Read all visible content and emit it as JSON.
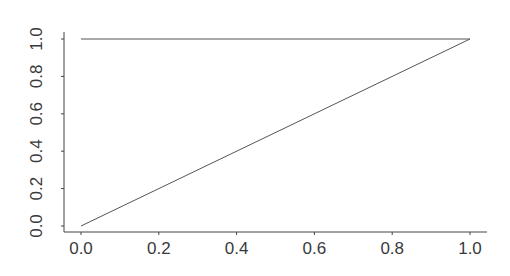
{
  "chart_data": {
    "type": "line",
    "title": "",
    "xlabel": "",
    "ylabel": "",
    "xlim": [
      0.0,
      1.0
    ],
    "ylim": [
      0.0,
      1.0
    ],
    "grid": false,
    "legend": null,
    "x_ticks": [
      "0.0",
      "0.2",
      "0.4",
      "0.6",
      "0.8",
      "1.0"
    ],
    "y_ticks": [
      "0.0",
      "0.2",
      "0.4",
      "0.6",
      "0.8",
      "1.0"
    ],
    "series": [
      {
        "name": "diagonal",
        "x": [
          0.0,
          1.0
        ],
        "y": [
          0.0,
          1.0
        ]
      },
      {
        "name": "horizontal",
        "x": [
          0.0,
          1.0
        ],
        "y": [
          1.0,
          1.0
        ]
      }
    ],
    "colors": {
      "line": "#555555",
      "axis": "#444444",
      "text": "#3a3a3a"
    }
  }
}
